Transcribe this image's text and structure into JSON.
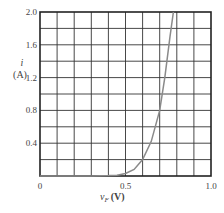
{
  "chart_data": {
    "type": "line",
    "title": "",
    "xlabel": "v_F (V)",
    "ylabel": "i (A)",
    "xlim": [
      0,
      1.0
    ],
    "ylim": [
      0,
      2.0
    ],
    "grid": true,
    "x_ticks": [
      "0",
      "0.5",
      "1.0"
    ],
    "y_ticks": [
      "0.4",
      "0.8",
      "1.2",
      "1.6",
      "2.0"
    ],
    "x_grid_step": 0.1,
    "y_grid_step": 0.2,
    "series": [
      {
        "name": "diode forward characteristic",
        "x": [
          0.0,
          0.1,
          0.2,
          0.3,
          0.4,
          0.45,
          0.5,
          0.55,
          0.6,
          0.65,
          0.7,
          0.73,
          0.76,
          0.78
        ],
        "y": [
          0.0,
          0.0,
          0.0,
          0.0,
          0.005,
          0.01,
          0.03,
          0.08,
          0.2,
          0.42,
          0.8,
          1.2,
          1.7,
          2.0
        ]
      }
    ],
    "colors": {
      "curve": "#8a8a8a",
      "grid": "#333333",
      "frame": "#222222"
    }
  },
  "labels": {
    "y_symbol": "i",
    "y_unit": "(A)",
    "x_symbol": "v",
    "x_subscript": "F",
    "x_unit": "(V)"
  }
}
